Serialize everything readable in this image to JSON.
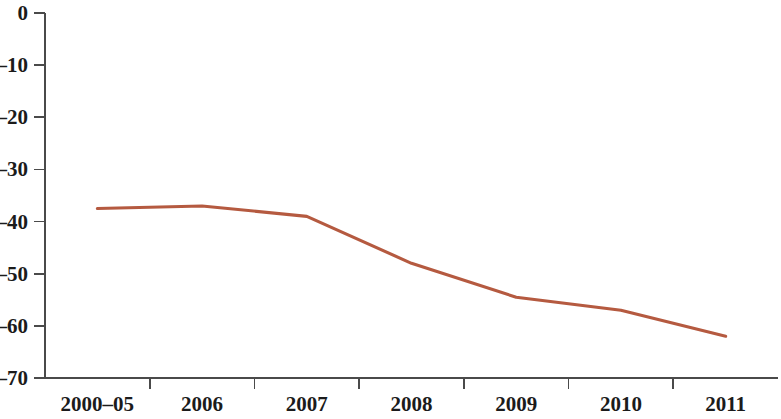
{
  "chart_data": {
    "type": "line",
    "title": "",
    "subtitle": "",
    "xlabel": "",
    "ylabel": "",
    "categories": [
      "2000–05",
      "2006",
      "2007",
      "2008",
      "2009",
      "2010",
      "2011"
    ],
    "series": [
      {
        "name": "series-1",
        "color": "#b55a40",
        "values": [
          -37.5,
          -37.0,
          -39.0,
          -48.0,
          -54.5,
          -57.0,
          -62.0
        ]
      }
    ],
    "ylim": [
      -70,
      0
    ],
    "y_ticks": [
      0,
      -10,
      -20,
      -30,
      -40,
      -50,
      -60,
      -70
    ],
    "y_tick_labels": [
      "0",
      "–10",
      "–20",
      "–30",
      "–40",
      "–50",
      "–60",
      "–70"
    ],
    "x_tick_labels": [
      "2000–05",
      "2006",
      "2007",
      "2008",
      "2009",
      "2010",
      "2011"
    ],
    "grid": false,
    "legend": "none",
    "legend_position": "none",
    "annotations": []
  },
  "axes": {
    "y_axis_color": "#4a4a4a",
    "x_axis_color": "#4a4a4a",
    "line_color": "#b55a40",
    "background": "#ffffff"
  }
}
